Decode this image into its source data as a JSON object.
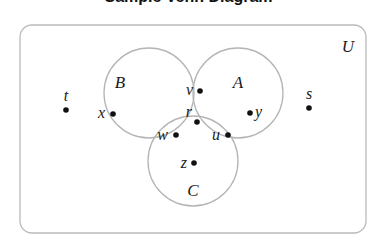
{
  "title": "Sample Venn Diagram",
  "universe": {
    "label": "U",
    "x": 20,
    "y": 25,
    "w": 346,
    "h": 208,
    "rx": 12,
    "stroke": "#bbbbbb"
  },
  "sets": [
    {
      "name": "B",
      "label": "B",
      "cx": 149,
      "cy": 93,
      "r": 45,
      "label_x": 120,
      "label_y": 88
    },
    {
      "name": "A",
      "label": "A",
      "cx": 238,
      "cy": 93,
      "r": 45,
      "label_x": 238,
      "label_y": 88
    },
    {
      "name": "C",
      "label": "C",
      "cx": 193,
      "cy": 161,
      "r": 45,
      "label_x": 193,
      "label_y": 196
    }
  ],
  "circle_stroke": "#b5b5b5",
  "points": [
    {
      "label": "t",
      "x": 66,
      "y": 110,
      "lx": 66,
      "ly": 101,
      "anchor": "middle"
    },
    {
      "label": "s",
      "x": 309,
      "y": 108,
      "lx": 309,
      "ly": 99,
      "anchor": "middle"
    },
    {
      "label": "x",
      "x": 113,
      "y": 114,
      "lx": 105,
      "ly": 118,
      "anchor": "end"
    },
    {
      "label": "y",
      "x": 250,
      "y": 113,
      "lx": 255,
      "ly": 117,
      "anchor": "start"
    },
    {
      "label": "v",
      "x": 200,
      "y": 91,
      "lx": 193,
      "ly": 95,
      "anchor": "end"
    },
    {
      "label": "r",
      "x": 197,
      "y": 122,
      "lx": 192,
      "ly": 117,
      "anchor": "end"
    },
    {
      "label": "w",
      "x": 176,
      "y": 135,
      "lx": 168,
      "ly": 140,
      "anchor": "end"
    },
    {
      "label": "u",
      "x": 228,
      "y": 135,
      "lx": 220,
      "ly": 140,
      "anchor": "end"
    },
    {
      "label": "z",
      "x": 194,
      "y": 163,
      "lx": 187,
      "ly": 168,
      "anchor": "end"
    }
  ]
}
